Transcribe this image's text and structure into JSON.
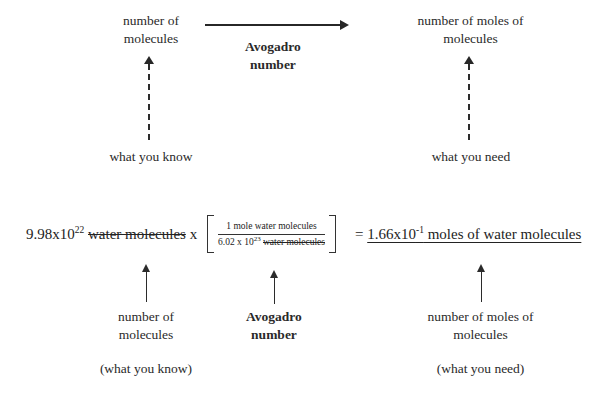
{
  "diagram": {
    "ink_color": "#2a2a2a",
    "accent_color": "#000000"
  },
  "concept_map": {
    "source": {
      "line1": "number of",
      "line2": "molecules",
      "known_label": "what you know"
    },
    "relation": {
      "line1": "Avogadro",
      "line2": "number",
      "arrow_icon": "right-arrow-icon"
    },
    "target": {
      "line1": "number of moles of",
      "line2": "molecules",
      "needed_label": "what you need"
    }
  },
  "equation": {
    "given": {
      "coefficient": "9.98x10",
      "exponent": "22",
      "unit_cancelled": "water molecules"
    },
    "multiply_symbol": "x",
    "conversion_factor": {
      "numerator": "1 mole water molecules",
      "denominator_coefficient": "6.02 x 10",
      "denominator_exponent": "23",
      "denominator_unit_cancelled": "water molecules"
    },
    "equals_symbol": "=",
    "result": {
      "coefficient": "1.66x10",
      "exponent": "-1",
      "unit": " moles of water molecules"
    }
  },
  "annotations": {
    "given_term": {
      "line1": "number of",
      "line2": "molecules",
      "parenthetical": "(what you know)",
      "arrow_icon": "up-arrow-icon"
    },
    "conversion_term": {
      "line1": "Avogadro",
      "line2": "number",
      "arrow_icon": "up-arrow-icon"
    },
    "result_term": {
      "line1": "number of moles of",
      "line2": "molecules",
      "parenthetical": "(what you need)",
      "arrow_icon": "up-arrow-icon"
    }
  }
}
